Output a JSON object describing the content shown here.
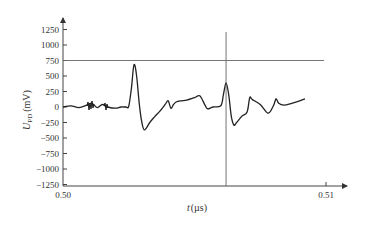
{
  "chart_data": {
    "type": "line",
    "title": "",
    "xlabel": "t (µs)",
    "xlabel_var": "t",
    "xlabel_unit": "(µs)",
    "ylabel": "U_PD (mV)",
    "ylabel_var": "U",
    "ylabel_sub": "PD",
    "ylabel_unit": "(mV)",
    "xlim": [
      0.5,
      0.51
    ],
    "ylim": [
      -1250,
      1250
    ],
    "x_ticks": [
      "0.50",
      "0.51"
    ],
    "y_ticks": [
      "1250",
      "1000",
      "750",
      "500",
      "250",
      "0",
      "−250",
      "−500",
      "−750",
      "−1000",
      "−1250"
    ],
    "y_tick_values": [
      1250,
      1000,
      750,
      500,
      250,
      0,
      -250,
      -500,
      -750,
      -1000,
      -1250
    ],
    "grid": false,
    "legend": null,
    "annotations": [
      {
        "type": "hline",
        "y": 750,
        "label": "threshold line"
      },
      {
        "type": "vline",
        "x": 0.5062,
        "label": "cursor"
      }
    ],
    "series": [
      {
        "name": "U_PD",
        "x": [
          0.5,
          0.5003,
          0.5006,
          0.5009,
          0.5011,
          0.5013,
          0.5015,
          0.5017,
          0.502,
          0.5022,
          0.5024,
          0.5025,
          0.5026,
          0.5027,
          0.5028,
          0.5029,
          0.503,
          0.5031,
          0.5033,
          0.5035,
          0.5037,
          0.5039,
          0.504,
          0.5041,
          0.5042,
          0.5043,
          0.5045,
          0.5047,
          0.505,
          0.5052,
          0.5054,
          0.5055,
          0.5057,
          0.506,
          0.5061,
          0.5062,
          0.5063,
          0.5064,
          0.5065,
          0.5066,
          0.5068,
          0.507,
          0.5071,
          0.5072,
          0.5075,
          0.5078,
          0.508,
          0.5081,
          0.5082,
          0.5084,
          0.5087,
          0.509,
          0.5092
        ],
        "values": [
          0,
          20,
          -10,
          30,
          60,
          -10,
          40,
          0,
          -20,
          0,
          0,
          10,
          300,
          680,
          500,
          50,
          -250,
          -370,
          -250,
          -150,
          -60,
          50,
          100,
          -20,
          40,
          80,
          100,
          110,
          150,
          180,
          30,
          -30,
          0,
          20,
          200,
          390,
          200,
          -150,
          -290,
          -250,
          -150,
          -80,
          150,
          120,
          40,
          -100,
          20,
          130,
          60,
          30,
          60,
          100,
          130
        ]
      }
    ]
  },
  "plot_area": {
    "x_axis_px_left": 63,
    "x_axis_px_right": 326,
    "y_zero_px": 107,
    "px_per_mV": 0.062
  }
}
